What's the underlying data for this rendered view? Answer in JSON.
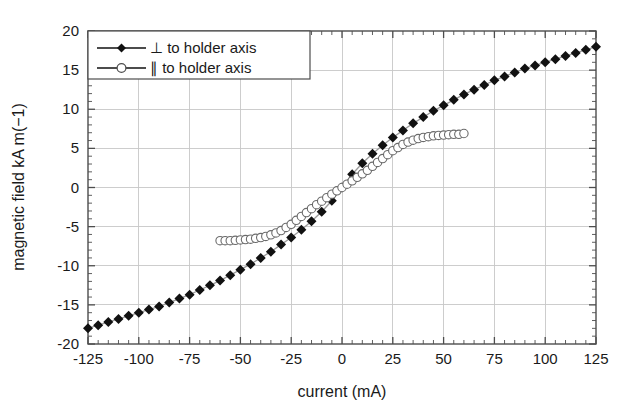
{
  "chart_data": {
    "type": "line",
    "title": "",
    "xlabel": "current (mA)",
    "ylabel": "magnetic field kA m(−1)",
    "xlim": [
      -125,
      125
    ],
    "ylim": [
      -20,
      20
    ],
    "xticks": [
      -125,
      -100,
      -75,
      -50,
      -25,
      0,
      25,
      50,
      75,
      100,
      125
    ],
    "yticks": [
      -20,
      -15,
      -10,
      -5,
      0,
      5,
      10,
      15,
      20
    ],
    "xtick_labels": [
      "-125",
      "-100",
      "-75",
      "-50",
      "-25",
      "0",
      "25",
      "50",
      "75",
      "100",
      "125"
    ],
    "ytick_labels": [
      "-20",
      "-15",
      "-10",
      "-5",
      "0",
      "5",
      "10",
      "15",
      "20"
    ],
    "x_minor_step": 5,
    "y_minor_step": 1,
    "grid": true,
    "grid_color": "#c8c8c8",
    "legend_position": "top-left",
    "series": [
      {
        "name": "⊥ to holder axis",
        "marker": "filled-diamond",
        "marker_color": "#111111",
        "line_color": "#9a9a9a",
        "x": [
          -125,
          -120,
          -115,
          -110,
          -105,
          -100,
          -95,
          -90,
          -85,
          -80,
          -75,
          -70,
          -65,
          -60,
          -55,
          -50,
          -45,
          -40,
          -35,
          -30,
          -25,
          -20,
          -15,
          -10,
          -5,
          0,
          5,
          10,
          15,
          20,
          25,
          30,
          35,
          40,
          45,
          50,
          55,
          60,
          65,
          70,
          75,
          80,
          85,
          90,
          95,
          100,
          105,
          110,
          115,
          120,
          125
        ],
        "y": [
          -18.0,
          -17.6,
          -17.2,
          -16.8,
          -16.4,
          -16.0,
          -15.6,
          -15.2,
          -14.7,
          -14.2,
          -13.7,
          -13.1,
          -12.5,
          -11.9,
          -11.2,
          -10.5,
          -9.8,
          -9.0,
          -8.2,
          -7.3,
          -6.4,
          -5.4,
          -4.3,
          -3.1,
          -1.7,
          0.0,
          1.7,
          3.1,
          4.3,
          5.4,
          6.4,
          7.3,
          8.2,
          9.0,
          9.8,
          10.5,
          11.2,
          11.9,
          12.5,
          13.1,
          13.7,
          14.2,
          14.7,
          15.2,
          15.6,
          16.0,
          16.4,
          16.8,
          17.2,
          17.6,
          18.0
        ]
      },
      {
        "name": "∥ to holder axis",
        "marker": "open-circle",
        "marker_color": "#ffffff",
        "marker_edge": "#6a6a6a",
        "line_color": "#9a9a9a",
        "x": [
          -60,
          -57.5,
          -55,
          -52.5,
          -50,
          -47.5,
          -45,
          -42.5,
          -40,
          -37.5,
          -35,
          -32.5,
          -30,
          -27.5,
          -25,
          -22.5,
          -20,
          -17.5,
          -15,
          -12.5,
          -10,
          -7.5,
          -5,
          -2.5,
          0,
          2.5,
          5,
          7.5,
          10,
          12.5,
          15,
          17.5,
          20,
          22.5,
          25,
          27.5,
          30,
          32.5,
          35,
          37.5,
          40,
          42.5,
          45,
          47.5,
          50,
          52.5,
          55,
          57.5,
          60
        ],
        "y": [
          -6.8,
          -6.8,
          -6.8,
          -6.75,
          -6.7,
          -6.65,
          -6.6,
          -6.5,
          -6.4,
          -6.25,
          -6.05,
          -5.8,
          -5.5,
          -5.1,
          -4.7,
          -4.2,
          -3.7,
          -3.2,
          -2.7,
          -2.2,
          -1.75,
          -1.3,
          -0.85,
          -0.42,
          0.0,
          0.42,
          0.85,
          1.3,
          1.75,
          2.2,
          2.7,
          3.2,
          3.7,
          4.2,
          4.7,
          5.1,
          5.5,
          5.8,
          6.05,
          6.25,
          6.4,
          6.5,
          6.6,
          6.65,
          6.7,
          6.75,
          6.8,
          6.8,
          6.9
        ]
      }
    ]
  },
  "legend": {
    "entries": [
      {
        "label": "⊥ to holder axis"
      },
      {
        "label": "∥ to holder axis"
      }
    ]
  },
  "axes": {
    "x_title": "current (mA)",
    "y_title": "magnetic field kA m(−1)"
  }
}
